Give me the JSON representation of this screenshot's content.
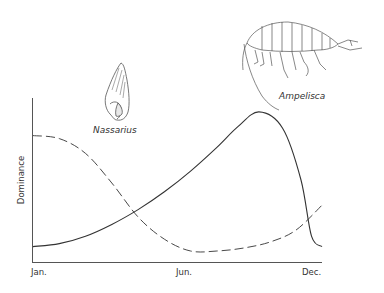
{
  "chart_data": {
    "type": "line",
    "title": "",
    "xlabel": "",
    "ylabel": "Dominance",
    "x_tick_labels": [
      "Jan.",
      "Jun.",
      "Dec."
    ],
    "x_domain_months": [
      1,
      12
    ],
    "y_range": [
      0,
      1
    ],
    "grid": false,
    "series": [
      {
        "name": "Ampelisca",
        "style": "solid",
        "points": [
          [
            1,
            0.05
          ],
          [
            2,
            0.07
          ],
          [
            3,
            0.12
          ],
          [
            4,
            0.2
          ],
          [
            5,
            0.3
          ],
          [
            6,
            0.42
          ],
          [
            7,
            0.56
          ],
          [
            8,
            0.72
          ],
          [
            8.8,
            0.86
          ],
          [
            9.6,
            0.96
          ],
          [
            10.5,
            0.85
          ],
          [
            11.2,
            0.5
          ],
          [
            11.6,
            0.12
          ],
          [
            12,
            0.05
          ]
        ]
      },
      {
        "name": "Nassarius",
        "style": "dashed",
        "points": [
          [
            1,
            0.8
          ],
          [
            2,
            0.78
          ],
          [
            3,
            0.68
          ],
          [
            4,
            0.48
          ],
          [
            5,
            0.25
          ],
          [
            6,
            0.1
          ],
          [
            7,
            0.02
          ],
          [
            8,
            0.02
          ],
          [
            9,
            0.04
          ],
          [
            10,
            0.08
          ],
          [
            11,
            0.16
          ],
          [
            12,
            0.33
          ]
        ]
      }
    ],
    "annotations": [
      {
        "text": "Nassarius",
        "type": "species-illustration-label"
      },
      {
        "text": "Ampelisca",
        "type": "species-illustration-label"
      }
    ]
  },
  "illustrations": {
    "nassarius": {
      "label": "Nassarius",
      "icon": "snail-shell-icon"
    },
    "ampelisca": {
      "label": "Ampelisca",
      "icon": "amphipod-icon"
    }
  }
}
